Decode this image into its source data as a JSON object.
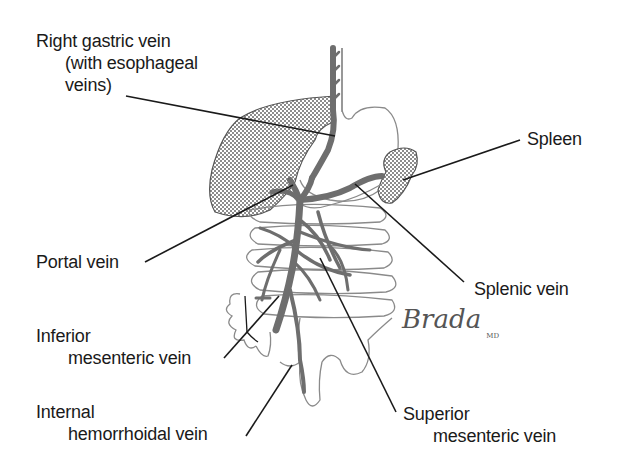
{
  "diagram": {
    "type": "anatomical-illustration",
    "labels": {
      "right_gastric_vein": {
        "line1": "Right gastric vein",
        "line2": "(with esophageal",
        "line3": "veins)"
      },
      "spleen": "Spleen",
      "portal_vein": "Portal vein",
      "splenic_vein": "Splenic vein",
      "inferior_mesenteric_vein": {
        "line1": "Inferior",
        "line2": "mesenteric vein"
      },
      "internal_hemorrhoidal_vein": {
        "line1": "Internal",
        "line2": "hemorrhoidal vein"
      },
      "superior_mesenteric_vein": {
        "line1": "Superior",
        "line2": "mesenteric vein"
      }
    },
    "signature": {
      "name": "Brada",
      "suffix": "MD"
    },
    "colors": {
      "vein": "#6e6e6e",
      "organ_outline": "#8a8a8a",
      "hatched_organ": "#b5b5b5",
      "leader_line": "#1a1a1a",
      "text": "#1a1a1a"
    }
  }
}
